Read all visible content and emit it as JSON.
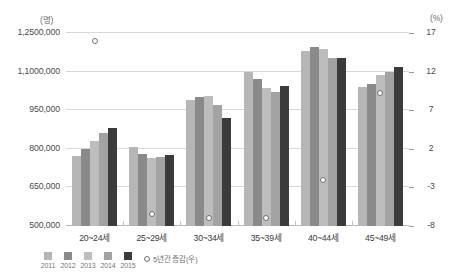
{
  "chart_data": {
    "type": "bar",
    "title": "",
    "subtitle": "",
    "xlabel": "",
    "ylabel": "(명)",
    "y2label": "(%)",
    "grid": true,
    "legend_position": "bottom-left",
    "categories": [
      "20~24세",
      "25~29세",
      "30~34세",
      "35~39세",
      "40~44세",
      "45~49세"
    ],
    "left_axis": {
      "unit": "(명)",
      "ticks": [
        "500,000",
        "650,000",
        "800,000",
        "950,000",
        "1,1000,000",
        "1,2500,000"
      ],
      "tick_values": [
        500000,
        650000,
        800000,
        950000,
        1100000,
        1250000
      ]
    },
    "right_axis": {
      "unit": "(%)",
      "ticks": [
        "-8",
        "-3",
        "2",
        "7",
        "12",
        "17"
      ],
      "tick_values": [
        -8,
        -3,
        2,
        7,
        12,
        17
      ]
    },
    "series": [
      {
        "name": "2011",
        "color": "#b6b6b6",
        "values": [
          772000,
          806000,
          991000,
          1097000,
          1181000,
          1040000
        ]
      },
      {
        "name": "2012",
        "color": "#8a8a8a",
        "values": [
          800000,
          781000,
          1000000,
          1071000,
          1196000,
          1050000
        ]
      },
      {
        "name": "2013",
        "color": "#bdbdbd",
        "values": [
          830000,
          764000,
          1005000,
          1036000,
          1186000,
          1086000
        ]
      },
      {
        "name": "2014",
        "color": "#a3a3a3",
        "values": [
          860000,
          770000,
          972000,
          1021000,
          1151000,
          1100000
        ]
      },
      {
        "name": "2015",
        "color": "#3b3b3b",
        "values": [
          881000,
          776000,
          921000,
          1046000,
          1151000,
          1117000
        ]
      }
    ],
    "marker_series": {
      "name": "5년간 증감(우)",
      "axis": "right",
      "values": [
        16.0,
        -6.4,
        -6.9,
        -7.0,
        -2.1,
        9.2
      ]
    }
  }
}
